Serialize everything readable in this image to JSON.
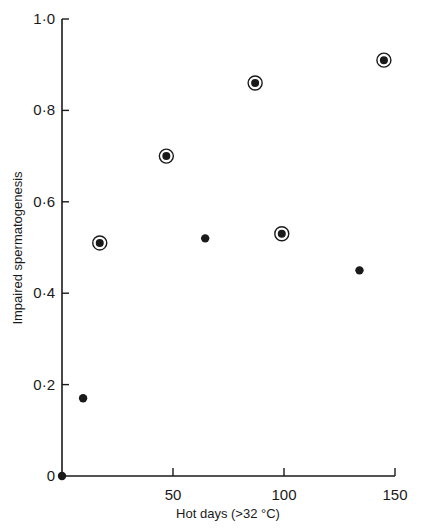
{
  "chart_data": {
    "type": "scatter",
    "title": "",
    "xlabel": "Hot days (>32 °C)",
    "ylabel": "Impaired spermatogenesis",
    "xlim": [
      0,
      150
    ],
    "ylim": [
      0,
      1.0
    ],
    "x_ticks": [
      0,
      50,
      100,
      150
    ],
    "x_tick_labels": [
      "50",
      "100",
      "150"
    ],
    "y_ticks": [
      0,
      0.2,
      0.4,
      0.6,
      0.8,
      1.0
    ],
    "y_tick_labels": [
      "0",
      "0·2",
      "0·4",
      "0·6",
      "0·8",
      "1·0"
    ],
    "grid": false,
    "legend": null,
    "series": [
      {
        "name": "circled points",
        "marker": "circled-dot",
        "points": [
          {
            "x": 17,
            "y": 0.51
          },
          {
            "x": 47,
            "y": 0.7
          },
          {
            "x": 87,
            "y": 0.86
          },
          {
            "x": 99,
            "y": 0.53
          },
          {
            "x": 145,
            "y": 0.91
          }
        ]
      },
      {
        "name": "filled points",
        "marker": "dot",
        "points": [
          {
            "x": 0,
            "y": 0.0
          },
          {
            "x": 9.5,
            "y": 0.17
          },
          {
            "x": 64.5,
            "y": 0.52
          },
          {
            "x": 134,
            "y": 0.45
          }
        ]
      }
    ]
  }
}
